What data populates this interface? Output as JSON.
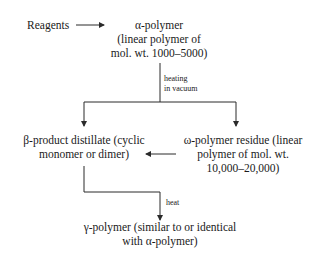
{
  "diagram": {
    "type": "flowchart",
    "nodes": {
      "reagents": {
        "label": "Reagents"
      },
      "alpha": {
        "lines": [
          "α-polymer",
          "(linear polymer of",
          "mol. wt. 1000–5000)"
        ]
      },
      "beta": {
        "lines": [
          "β-product distillate (cyclic",
          "monomer or dimer)"
        ]
      },
      "omega": {
        "lines": [
          "ω-polymer residue (linear",
          "polymer of mol. wt.",
          "10,000–20,000)"
        ]
      },
      "gamma": {
        "lines": [
          "γ-polymer (similar to or identical",
          "with α-polymer)"
        ]
      }
    },
    "edge_labels": {
      "heating": [
        "heating",
        "in vacuum"
      ],
      "heat": "heat"
    },
    "edges": [
      {
        "from": "reagents",
        "to": "alpha",
        "label": ""
      },
      {
        "from": "alpha",
        "to": "beta",
        "label": "heating in vacuum"
      },
      {
        "from": "alpha",
        "to": "omega",
        "label": "heating in vacuum"
      },
      {
        "from": "omega",
        "to": "beta",
        "label": ""
      },
      {
        "from": "beta",
        "to": "gamma",
        "label": "heat"
      }
    ],
    "colors": {
      "line": "#2a2a2a",
      "text": "#1a1a1a",
      "background": "#ffffff"
    }
  }
}
